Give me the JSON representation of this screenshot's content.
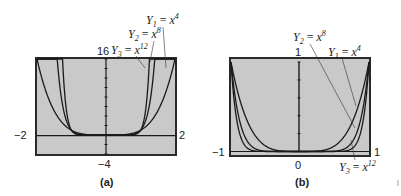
{
  "chart_data": [
    {
      "type": "line",
      "panel": "(a)",
      "title": "",
      "xlim": [
        -2,
        2
      ],
      "ylim": [
        -4,
        16
      ],
      "x_tick_labels": [
        "-2",
        "2"
      ],
      "y_tick_labels": [
        "16",
        "-4"
      ],
      "grid": false,
      "series": [
        {
          "name": "Y1 = x^4",
          "exponent": 4
        },
        {
          "name": "Y2 = x^8",
          "exponent": 8
        },
        {
          "name": "Y3 = x^12",
          "exponent": 12
        }
      ],
      "annotations": [
        "Y1 = x4",
        "Y2 = x8",
        "Y3 = x12"
      ]
    },
    {
      "type": "line",
      "panel": "(b)",
      "title": "",
      "xlim": [
        -1,
        1
      ],
      "ylim": [
        0,
        1
      ],
      "x_tick_labels": [
        "-1",
        "1"
      ],
      "y_tick_labels": [
        "1",
        "0"
      ],
      "grid": false,
      "series": [
        {
          "name": "Y1 = x^4",
          "exponent": 4
        },
        {
          "name": "Y2 = x^8",
          "exponent": 8
        },
        {
          "name": "Y3 = x^12",
          "exponent": 12
        }
      ],
      "annotations": [
        "Y2 = x8",
        "Y1 = x4",
        "Y3 = x12"
      ]
    }
  ],
  "panels": {
    "a": {
      "caption": "(a)",
      "xmin": "−2",
      "xmax": "2",
      "ymax": "16",
      "ymin": "−4"
    },
    "b": {
      "caption": "(b)",
      "xmin": "−1",
      "xmax": "1",
      "ymax": "1",
      "ymin": "0"
    }
  },
  "labels": {
    "Y": "Y",
    "x": "x",
    "sub1": "1",
    "sub2": "2",
    "sub3": "3",
    "eq": " = ",
    "e4": "4",
    "e8": "8",
    "e12": "12"
  },
  "colors": {
    "plot_bg": "#c9c9c9",
    "frame": "#2a2a2a",
    "curve": "#1a1a1a"
  }
}
